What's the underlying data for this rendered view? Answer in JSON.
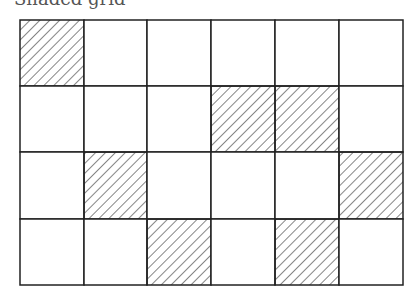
{
  "caption": "Shaded grid",
  "grid": {
    "rows": 4,
    "cols": 6,
    "x": [
      20,
      84,
      147,
      211,
      275,
      339,
      403
    ],
    "y": [
      20,
      86,
      152,
      219,
      285
    ],
    "shaded": [
      [
        0,
        0
      ],
      [
        1,
        3
      ],
      [
        1,
        4
      ],
      [
        2,
        1
      ],
      [
        2,
        5
      ],
      [
        3,
        2
      ],
      [
        3,
        4
      ]
    ],
    "line_color": "#222222",
    "hatch_color": "#333333"
  }
}
